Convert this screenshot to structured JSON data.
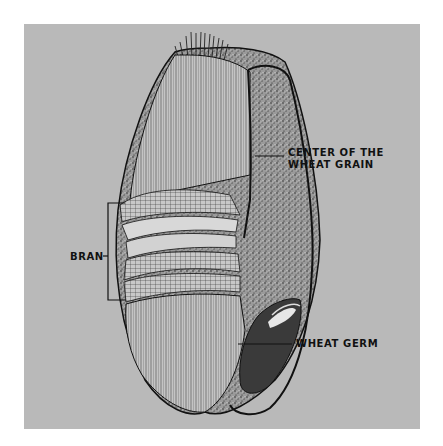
{
  "figure": {
    "background_color": "#b9b9b9",
    "line_color": "#111111"
  },
  "labels": {
    "center_line1": "CENTER OF THE",
    "center_line2": "WHEAT GRAIN",
    "germ": "WHEAT GERM",
    "bran": "BRAN"
  }
}
